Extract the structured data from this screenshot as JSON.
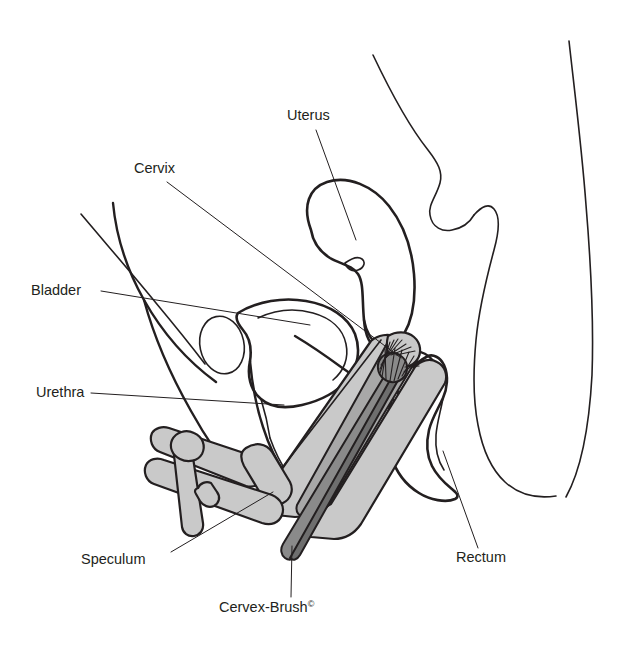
{
  "figure": {
    "colors": {
      "ink": "#231f20",
      "speculum_fill": "#c9c9c9",
      "speculum_shadow": "#a8a8a8",
      "brush_handle": "#8a8a8a",
      "brush_handle_dark": "#6e6e6e",
      "background": "#ffffff"
    },
    "labels": [
      {
        "id": "uterus",
        "text": "Uterus",
        "x": 287,
        "y": 120
      },
      {
        "id": "cervix",
        "text": "Cervix",
        "x": 134,
        "y": 173
      },
      {
        "id": "bladder",
        "text": "Bladder",
        "x": 31,
        "y": 295
      },
      {
        "id": "urethra",
        "text": "Urethra",
        "x": 36,
        "y": 397
      },
      {
        "id": "speculum",
        "text": "Speculum",
        "x": 81,
        "y": 564
      },
      {
        "id": "rectum",
        "text": "Rectum",
        "x": 456,
        "y": 562
      },
      {
        "id": "cervex_brush",
        "text": "Cervex-Brush",
        "superscript": "©",
        "x": 219,
        "y": 612
      }
    ],
    "parts": [
      {
        "id": "body-outline",
        "name": "body-outline"
      },
      {
        "id": "uterus",
        "name": "uterus-organ"
      },
      {
        "id": "cervix",
        "name": "cervix-organ"
      },
      {
        "id": "bladder",
        "name": "bladder-organ"
      },
      {
        "id": "urethra",
        "name": "urethra-duct"
      },
      {
        "id": "rectum",
        "name": "rectum-organ"
      },
      {
        "id": "vagina",
        "name": "vaginal-canal"
      },
      {
        "id": "speculum",
        "name": "speculum-instrument"
      },
      {
        "id": "cervex-brush",
        "name": "cervex-brush-instrument"
      }
    ]
  }
}
